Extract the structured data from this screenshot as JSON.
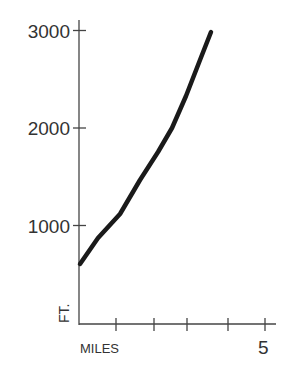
{
  "chart_data": {
    "type": "line",
    "title": "",
    "xlabel": "MILES",
    "ylabel": "FT.",
    "xlim": [
      0,
      5
    ],
    "ylim": [
      0,
      3000
    ],
    "x_ticks": [
      1,
      2,
      3,
      4,
      5
    ],
    "x_tick_labels": [
      "",
      "",
      "",
      "",
      "5"
    ],
    "y_ticks": [
      1000,
      2000,
      3000
    ],
    "y_tick_labels": [
      "1000",
      "2000",
      "3000"
    ],
    "grid": false,
    "legend": null,
    "series": [
      {
        "name": "elevation",
        "color": "#1a1a1a",
        "x": [
          0,
          0.5,
          1.1,
          1.9,
          2.5,
          3.6
        ],
        "y": [
          600,
          900,
          1100,
          1700,
          2000,
          3000
        ]
      }
    ]
  },
  "labels": {
    "y_3000": "3000",
    "y_2000": "2000",
    "y_1000": "1000",
    "ylabel": "FT.",
    "xlabel": "MILES",
    "x_5": "5"
  },
  "colors": {
    "axis": "#444444",
    "line": "#1a1a1a"
  }
}
